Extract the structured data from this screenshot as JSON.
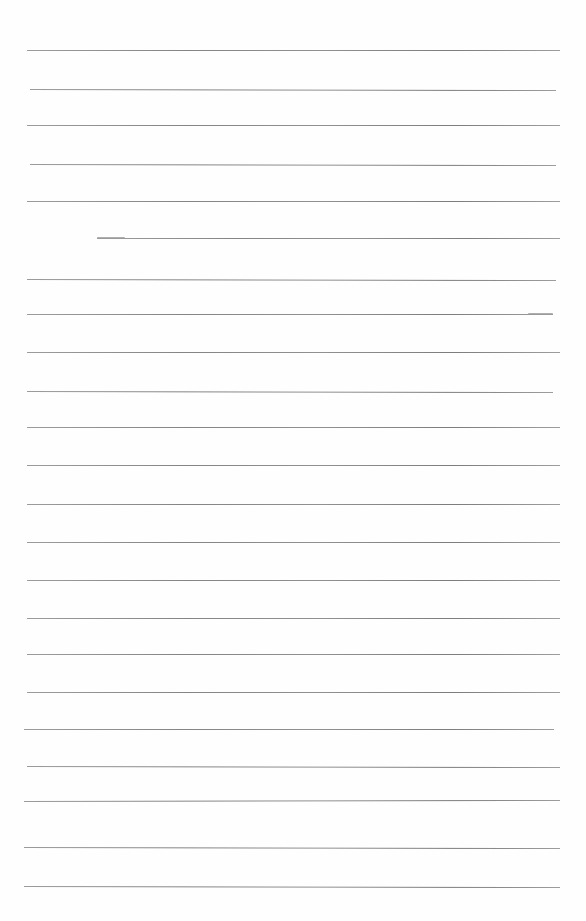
{
  "document": {
    "type": "lined-paper",
    "background_color": "#fefefe",
    "line_color": "#777777",
    "text_content": "",
    "rules": [
      {
        "y": 50,
        "x1": 27,
        "x2": 560,
        "tilt": 0
      },
      {
        "y": 89,
        "x1": 30,
        "x2": 556,
        "tilt": 1
      },
      {
        "y": 125,
        "x1": 27,
        "x2": 560,
        "tilt": 0
      },
      {
        "y": 164,
        "x1": 30,
        "x2": 556,
        "tilt": 1
      },
      {
        "y": 201,
        "x1": 27,
        "x2": 560,
        "tilt": 0
      },
      {
        "y": 238,
        "x1": 97,
        "x2": 560,
        "tilt": 0
      },
      {
        "y": 279,
        "x1": 27,
        "x2": 556,
        "tilt": 1
      },
      {
        "y": 314,
        "x1": 27,
        "x2": 553,
        "tilt": 0
      },
      {
        "y": 352,
        "x1": 27,
        "x2": 560,
        "tilt": 0
      },
      {
        "y": 391,
        "x1": 27,
        "x2": 553,
        "tilt": 1
      },
      {
        "y": 427,
        "x1": 27,
        "x2": 560,
        "tilt": 0
      },
      {
        "y": 465,
        "x1": 27,
        "x2": 560,
        "tilt": 0
      },
      {
        "y": 504,
        "x1": 27,
        "x2": 560,
        "tilt": 0
      },
      {
        "y": 542,
        "x1": 27,
        "x2": 560,
        "tilt": 0
      },
      {
        "y": 580,
        "x1": 27,
        "x2": 560,
        "tilt": 0
      },
      {
        "y": 618,
        "x1": 27,
        "x2": 560,
        "tilt": 0
      },
      {
        "y": 654,
        "x1": 27,
        "x2": 560,
        "tilt": 0
      },
      {
        "y": 692,
        "x1": 27,
        "x2": 560,
        "tilt": 0
      },
      {
        "y": 729,
        "x1": 24,
        "x2": 554,
        "tilt": 0
      },
      {
        "y": 766,
        "x1": 27,
        "x2": 560,
        "tilt": 1
      },
      {
        "y": 801,
        "x1": 24,
        "x2": 560,
        "tilt": -1
      },
      {
        "y": 847,
        "x1": 24,
        "x2": 560,
        "tilt": 1
      },
      {
        "y": 886,
        "x1": 24,
        "x2": 560,
        "tilt": 1
      }
    ],
    "smudges": [
      {
        "x": 97,
        "y": 237,
        "w": 28
      },
      {
        "x": 528,
        "y": 313,
        "w": 25
      }
    ]
  }
}
